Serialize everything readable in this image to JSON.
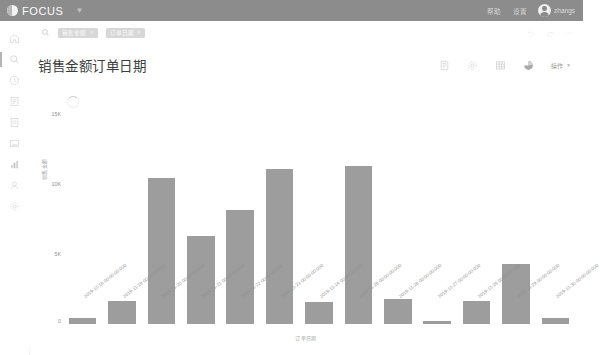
{
  "topbar": {
    "brand": "FOCUS",
    "brand_icon": "focus-logo-icon",
    "menu_caret_icon": "chevron-down-icon",
    "links": [
      {
        "label": "帮助",
        "name": "help"
      },
      {
        "label": "设置",
        "name": "settings"
      }
    ],
    "avatar_icon": "user-avatar-icon",
    "user_name": "zhangs",
    "bg_color": "#8c8c8c"
  },
  "sidebar": {
    "items": [
      {
        "label": "首页",
        "icon": "home-icon",
        "active": false
      },
      {
        "label": "搜索",
        "icon": "search-icon",
        "active": true
      },
      {
        "label": "最近",
        "icon": "clock-icon",
        "active": false
      },
      {
        "label": "报表",
        "icon": "list-document-icon",
        "active": false
      },
      {
        "label": "数据集",
        "icon": "file-icon",
        "active": false
      },
      {
        "label": "素材",
        "icon": "image-icon",
        "active": false
      },
      {
        "label": "图表",
        "icon": "bar-chart-icon",
        "active": false
      },
      {
        "label": "用户",
        "icon": "user-icon",
        "active": false
      },
      {
        "label": "系统设置",
        "icon": "gear-icon",
        "active": false
      }
    ]
  },
  "filterbar": {
    "search_icon": "search-icon",
    "chips": [
      {
        "label": "销售金额",
        "close_icon": "close-icon"
      },
      {
        "label": "订单日期",
        "close_icon": "close-icon"
      }
    ],
    "right_icons": [
      {
        "name": "undo-icon"
      },
      {
        "name": "redo-icon"
      },
      {
        "name": "more-icon"
      }
    ]
  },
  "panel": {
    "title": "销售金额订单日期",
    "tools": [
      {
        "name": "report-icon",
        "glyph": "report"
      },
      {
        "name": "gear-icon",
        "glyph": "gear"
      },
      {
        "name": "table-icon",
        "glyph": "table"
      },
      {
        "name": "pie-chart-icon",
        "glyph": "pie"
      }
    ],
    "operation_label": "操作",
    "operation_caret_icon": "chevron-down-icon"
  },
  "chart_data": {
    "type": "bar",
    "title": "销售金额订单日期",
    "xlabel": "订单日期",
    "ylabel": "销售金额",
    "ylim": [
      0,
      15000
    ],
    "yticks": [
      0,
      5000,
      10000,
      15000
    ],
    "ytick_labels": [
      "0",
      "5K",
      "10K",
      "15K"
    ],
    "grid": false,
    "legend": "none",
    "bar_color": "#9d9d9d",
    "categories": [
      "2019-11-18 00:00:00.000",
      "2019-11-19 00:00:00.000",
      "2019-11-20 00:00:00.000",
      "2019-11-21 00:00:00.000",
      "2019-11-22 00:00:00.000",
      "2019-11-23 00:00:00.000",
      "2019-11-24 00:00:00.000",
      "2019-11-25 00:00:00.000",
      "2019-11-26 00:00:00.000",
      "2019-11-27 00:00:00.000",
      "2019-11-28 00:00:00.000",
      "2019-11-29 00:00:00.000",
      "2019-11-30 00:00:00.000"
    ],
    "values": [
      400,
      1650,
      10400,
      6250,
      8100,
      11000,
      1600,
      11200,
      1750,
      200,
      1650,
      4300,
      400
    ]
  }
}
